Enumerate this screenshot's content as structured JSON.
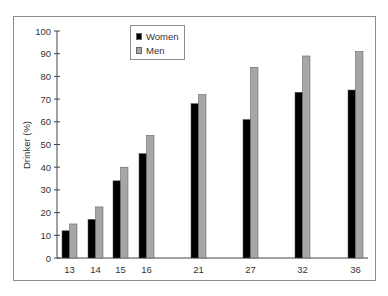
{
  "chart_data": {
    "type": "bar",
    "title": "",
    "xlabel": "",
    "ylabel": "Drinker (%)",
    "ylim": [
      0,
      100
    ],
    "yticks": [
      0,
      10,
      20,
      30,
      40,
      50,
      60,
      70,
      80,
      90,
      100
    ],
    "categories": [
      "13",
      "14",
      "15",
      "16",
      "21",
      "27",
      "32",
      "36"
    ],
    "series": [
      {
        "name": "Women",
        "color": "#000000",
        "values": [
          12,
          17,
          34,
          46,
          68,
          61,
          73,
          74
        ]
      },
      {
        "name": "Men",
        "color": "#a6a6a6",
        "values": [
          15,
          22.5,
          40,
          54,
          72,
          84,
          89,
          91
        ]
      }
    ],
    "legend_position": "top-left",
    "grid": false
  },
  "legend": {
    "women_label": "Women",
    "men_label": "Men"
  },
  "axis": {
    "ylabel": "Drinker (%)"
  }
}
